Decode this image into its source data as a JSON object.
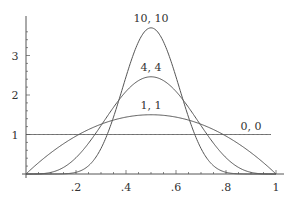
{
  "chart_data": {
    "type": "line",
    "title": "",
    "xlabel": "",
    "ylabel": "",
    "xlim": [
      0,
      1
    ],
    "ylim": [
      0,
      4
    ],
    "x_ticks": [
      {
        "value": 0.2,
        "label": ".2"
      },
      {
        "value": 0.4,
        "label": ".4"
      },
      {
        "value": 0.6,
        "label": ".6"
      },
      {
        "value": 0.8,
        "label": ".8"
      },
      {
        "value": 1.0,
        "label": "1"
      }
    ],
    "y_ticks": [
      {
        "value": 1,
        "label": "1"
      },
      {
        "value": 2,
        "label": "2"
      },
      {
        "value": 3,
        "label": "3"
      }
    ],
    "grid": false,
    "legend": "inline labels on curves",
    "series": [
      {
        "name": "10, 10",
        "a": 11,
        "b": 11,
        "peak": 3.7,
        "label_pos": [
          0.5,
          3.85
        ]
      },
      {
        "name": "4, 4",
        "a": 5,
        "b": 5,
        "peak": 2.46,
        "label_pos": [
          0.5,
          2.6
        ]
      },
      {
        "name": "1, 1",
        "a": 2,
        "b": 2,
        "peak": 1.5,
        "label_pos": [
          0.5,
          1.65
        ]
      },
      {
        "name": "0, 0",
        "a": 1,
        "b": 1,
        "peak": 1.0,
        "label_pos": [
          0.9,
          1.12
        ]
      }
    ]
  },
  "colors": {
    "axis": "#555555",
    "line": "#555555",
    "text": "#333333"
  }
}
